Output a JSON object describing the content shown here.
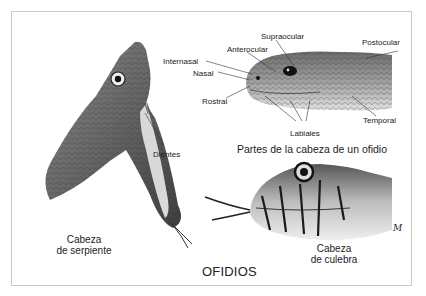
{
  "figure": {
    "title": "OFIDIOS",
    "signature": "M"
  },
  "serpent_head": {
    "caption_line1": "Cabeza",
    "caption_line2": "de serpiente",
    "labels": {
      "teeth": "Dientes"
    }
  },
  "parts_diagram": {
    "caption": "Partes de la cabeza de un ofidio",
    "labels": {
      "supraocular": "Supraocular",
      "anterocular": "Anterocular",
      "internasal": "Internasal",
      "nasal": "Nasal",
      "rostral": "Rostral",
      "postocular": "Postocular",
      "temporal": "Temporal",
      "labiales": "Labiales"
    }
  },
  "colubrid_head": {
    "caption_line1": "Cabeza",
    "caption_line2": "de culebra"
  }
}
